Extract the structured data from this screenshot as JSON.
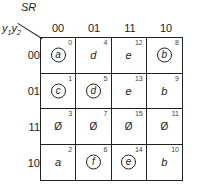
{
  "axes": {
    "column_var": "SR",
    "row_var_1": "y",
    "row_var_sub1": "1",
    "row_var_2": "y",
    "row_var_sub2": "2"
  },
  "columns": [
    "00",
    "01",
    "11",
    "10"
  ],
  "rows": [
    "00",
    "01",
    "11",
    "10"
  ],
  "cells": [
    [
      {
        "index": "0",
        "value": "a",
        "circled": true
      },
      {
        "index": "4",
        "value": "d",
        "circled": false
      },
      {
        "index": "12",
        "value": "e",
        "circled": false
      },
      {
        "index": "8",
        "value": "b",
        "circled": true
      }
    ],
    [
      {
        "index": "1",
        "value": "c",
        "circled": true
      },
      {
        "index": "5",
        "value": "d",
        "circled": true
      },
      {
        "index": "13",
        "value": "e",
        "circled": false
      },
      {
        "index": "9",
        "value": "b",
        "circled": false
      }
    ],
    [
      {
        "index": "3",
        "value": "Ø",
        "circled": false
      },
      {
        "index": "7",
        "value": "Ø",
        "circled": false
      },
      {
        "index": "15",
        "value": "Ø",
        "circled": false
      },
      {
        "index": "11",
        "value": "Ø",
        "circled": false
      }
    ],
    [
      {
        "index": "2",
        "value": "a",
        "circled": false
      },
      {
        "index": "6",
        "value": "f",
        "circled": true
      },
      {
        "index": "14",
        "value": "e",
        "circled": true
      },
      {
        "index": "10",
        "value": "b",
        "circled": false
      }
    ]
  ]
}
